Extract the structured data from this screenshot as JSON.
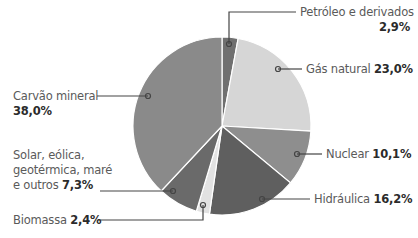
{
  "chart_data": {
    "type": "pie",
    "title": "",
    "start_angle_deg": 0,
    "direction": "clockwise",
    "center": [
      222,
      126
    ],
    "radius": 89,
    "slices": [
      {
        "name": "Petróleo e derivados",
        "value": 2.9,
        "value_label": "2,9%",
        "color": "#707070"
      },
      {
        "name": "Gás natural",
        "value": 23.0,
        "value_label": "23,0%",
        "color": "#d6d6d6"
      },
      {
        "name": "Nuclear",
        "value": 10.1,
        "value_label": "10,1%",
        "color": "#8e8e8e"
      },
      {
        "name": "Hidráulica",
        "value": 16.2,
        "value_label": "16,2%",
        "color": "#5f5f5f"
      },
      {
        "name": "Biomassa",
        "value": 2.4,
        "value_label": "2,4%",
        "color": "#e2e2e2"
      },
      {
        "name": "Solar, eólica, geotérmica, maré e outros",
        "value": 7.3,
        "value_label": "7,3%",
        "color": "#6a6a6a"
      },
      {
        "name": "Carvão mineral",
        "value": 38.0,
        "value_label": "38,0%",
        "color": "#8a8a8a"
      }
    ],
    "legend": "callout labels with leader lines"
  },
  "labels": {
    "petroleo": {
      "name": "Petróleo e derivados",
      "value": "2,9%"
    },
    "gas": {
      "name": "Gás natural",
      "value": "23,0%"
    },
    "nuclear": {
      "name": "Nuclear",
      "value": "10,1%"
    },
    "hidraulica": {
      "name": "Hidráulica",
      "value": "16,2%"
    },
    "biomassa": {
      "name": "Biomassa",
      "value": "2,4%"
    },
    "solar": {
      "line1": "Solar, eólica,",
      "line2": "geotérmica, maré",
      "line3": "e outros",
      "value": "7,3%"
    },
    "carvao": {
      "name": "Carvão mineral",
      "value": "38,0%"
    }
  },
  "colors": {
    "separator": "#ffffff",
    "leader": "#444444"
  }
}
